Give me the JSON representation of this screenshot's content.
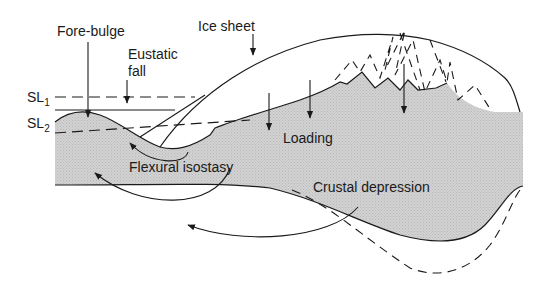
{
  "diagram": {
    "labels": {
      "fore_bulge": "Fore-bulge",
      "eustatic_fall_line1": "Eustatic",
      "eustatic_fall_line2": "fall",
      "ice_sheet": "Ice sheet",
      "sl1_main": "SL",
      "sl1_sub": "1",
      "sl2_main": "SL",
      "sl2_sub": "2",
      "loading": "Loading",
      "flexural_isostasy": "Flexural isostasy",
      "crustal_depression": "Crustal depression"
    },
    "colors": {
      "crust_fill": "#cfcfcf",
      "line": "#1a1a1a",
      "background": "#ffffff"
    }
  }
}
